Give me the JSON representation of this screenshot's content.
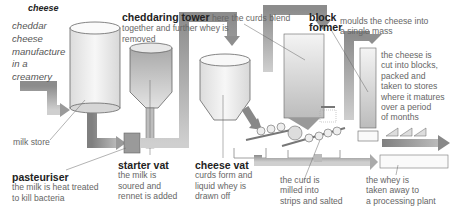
{
  "title": "cheese",
  "intro": "cheddar\ncheese\nmanufacture\nin a\ncreamery",
  "labels": {
    "milk_store": "milk store",
    "pasteuriser": {
      "head": "pasteuriser",
      "text": "the milk is heat treated\nto kill bacteria"
    },
    "starter_vat": {
      "head": "starter vat",
      "text": "the milk is\nsoured and\nrennet is added"
    },
    "cheese_vat": {
      "head": "cheese vat",
      "text": "curds form and\nliquid whey is\ndrawn off"
    },
    "cheddaring_tower": {
      "head": "cheddaring tower",
      "text_inline": "here the curds blend",
      "text": "together and further whey is\nremoved"
    },
    "block_former": {
      "head": "block\nformer",
      "text": "moulds the cheese into\n          a single mass"
    },
    "blocks": "the cheese is\ncut into blocks,\npacked and\ntaken to stores\nwhere it matures\nover a period\nof months",
    "curd_milled": "the curd is\nmilled into\nstrips and salted",
    "whey": "the whey is\ntaken away to\na processing plant"
  },
  "colors": {
    "pipe": "#8a8a8a",
    "pipe_light": "#c9c9c9",
    "outline": "#666666",
    "tank_fill": "#eeeeee"
  }
}
